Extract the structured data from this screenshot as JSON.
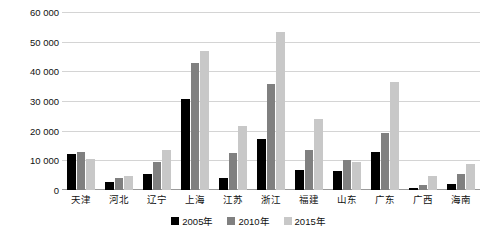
{
  "chart_data": {
    "type": "bar",
    "title": "",
    "xlabel": "",
    "ylabel": "",
    "ylim": [
      0,
      60000
    ],
    "yticks": [
      0,
      10000,
      20000,
      30000,
      40000,
      50000,
      60000
    ],
    "ytick_labels": [
      "0",
      "10 000",
      "20 000",
      "30 000",
      "40 000",
      "50 000",
      "60 000"
    ],
    "grid": true,
    "legend_position": "bottom",
    "categories": [
      "天津",
      "河北",
      "辽宁",
      "上海",
      "江苏",
      "浙江",
      "福建",
      "山东",
      "广东",
      "广西",
      "海南"
    ],
    "series": [
      {
        "name": "2005年",
        "color": "#000000",
        "values": [
          12200,
          2800,
          5400,
          30800,
          4000,
          17100,
          6600,
          6500,
          12800,
          700,
          1900
        ]
      },
      {
        "name": "2010年",
        "color": "#808080",
        "values": [
          12900,
          4200,
          9300,
          42800,
          12600,
          35600,
          13400,
          10100,
          19200,
          1700,
          5400
        ]
      },
      {
        "name": "2015年",
        "color": "#c8c8c8",
        "values": [
          10300,
          4700,
          13400,
          46700,
          21700,
          53300,
          23900,
          9400,
          36400,
          4800,
          8800
        ]
      }
    ]
  },
  "legend": {
    "items": [
      {
        "label": "2005年",
        "color": "#000000"
      },
      {
        "label": "2010年",
        "color": "#808080"
      },
      {
        "label": "2015年",
        "color": "#c8c8c8"
      }
    ]
  }
}
